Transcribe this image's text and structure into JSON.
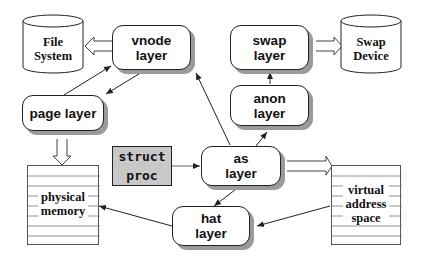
{
  "diagram": {
    "title": "",
    "nodes": {
      "file_system": {
        "label": "File\nSystem",
        "shape": "cylinder"
      },
      "vnode_layer": {
        "label": "vnode\nlayer",
        "shape": "rounded-rect"
      },
      "swap_layer": {
        "label": "swap\nlayer",
        "shape": "rounded-rect"
      },
      "swap_device": {
        "label": "Swap\nDevice",
        "shape": "cylinder"
      },
      "page_layer": {
        "label": "page layer",
        "shape": "rounded-rect"
      },
      "anon_layer": {
        "label": "anon\nlayer",
        "shape": "rounded-rect"
      },
      "struct_proc": {
        "label": "struct\nproc",
        "shape": "rect-shaded"
      },
      "as_layer": {
        "label": "as\nlayer",
        "shape": "rounded-rect"
      },
      "physical_memory": {
        "label": "physical\nmemory",
        "shape": "striped-rect"
      },
      "hat_layer": {
        "label": "hat\nlayer",
        "shape": "rounded-rect"
      },
      "virtual_address_space": {
        "label": "virtual\naddress\nspace",
        "shape": "striped-rect"
      }
    },
    "edges": [
      {
        "from": "vnode_layer",
        "to": "file_system",
        "style": "hollow-double-arrow"
      },
      {
        "from": "swap_layer",
        "to": "swap_device",
        "style": "hollow-double-arrow"
      },
      {
        "from": "page_layer",
        "to": "physical_memory",
        "style": "hollow-double-arrow"
      },
      {
        "from": "as_layer",
        "to": "virtual_address_space",
        "style": "hollow-double-arrow"
      },
      {
        "from": "page_layer",
        "to": "vnode_layer",
        "style": "arrow"
      },
      {
        "from": "vnode_layer",
        "to": "page_layer",
        "style": "arrow"
      },
      {
        "from": "anon_layer",
        "to": "swap_layer",
        "style": "arrow"
      },
      {
        "from": "as_layer",
        "to": "vnode_layer",
        "style": "arrow"
      },
      {
        "from": "as_layer",
        "to": "anon_layer",
        "style": "arrow"
      },
      {
        "from": "struct_proc",
        "to": "as_layer",
        "style": "thin-arrow"
      },
      {
        "from": "as_layer",
        "to": "hat_layer",
        "style": "arrow"
      },
      {
        "from": "hat_layer",
        "to": "physical_memory",
        "style": "arrow"
      },
      {
        "from": "virtual_address_space",
        "to": "hat_layer",
        "style": "arrow"
      }
    ]
  },
  "colors": {
    "stroke": "#222222",
    "shadow": "#9a9a9a",
    "proc_fill": "#c8c8c8",
    "background": "#ffffff"
  }
}
